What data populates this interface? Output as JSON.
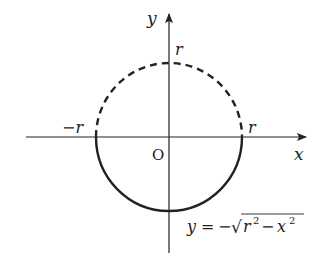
{
  "diagram": {
    "axes": {
      "x_label": "x",
      "y_label": "y",
      "origin_label": "O"
    },
    "ticks": {
      "x_positive": "r",
      "x_negative": "−r",
      "y_positive": "r"
    },
    "curves": [
      {
        "name": "upper semicircle",
        "style": "dashed",
        "equation": "y = √(r² − x²)"
      },
      {
        "name": "lower semicircle",
        "style": "solid",
        "equation": "y = −√(r² − x²)"
      }
    ],
    "equation_label": {
      "lhs": "y",
      "eq": "=",
      "minus": "−",
      "sqrt": "√",
      "r": "r",
      "r_exp": "2",
      "inner_minus": "−",
      "x": "x",
      "x_exp": "2"
    },
    "colors": {
      "stroke": "#222222",
      "background": "#ffffff"
    }
  }
}
